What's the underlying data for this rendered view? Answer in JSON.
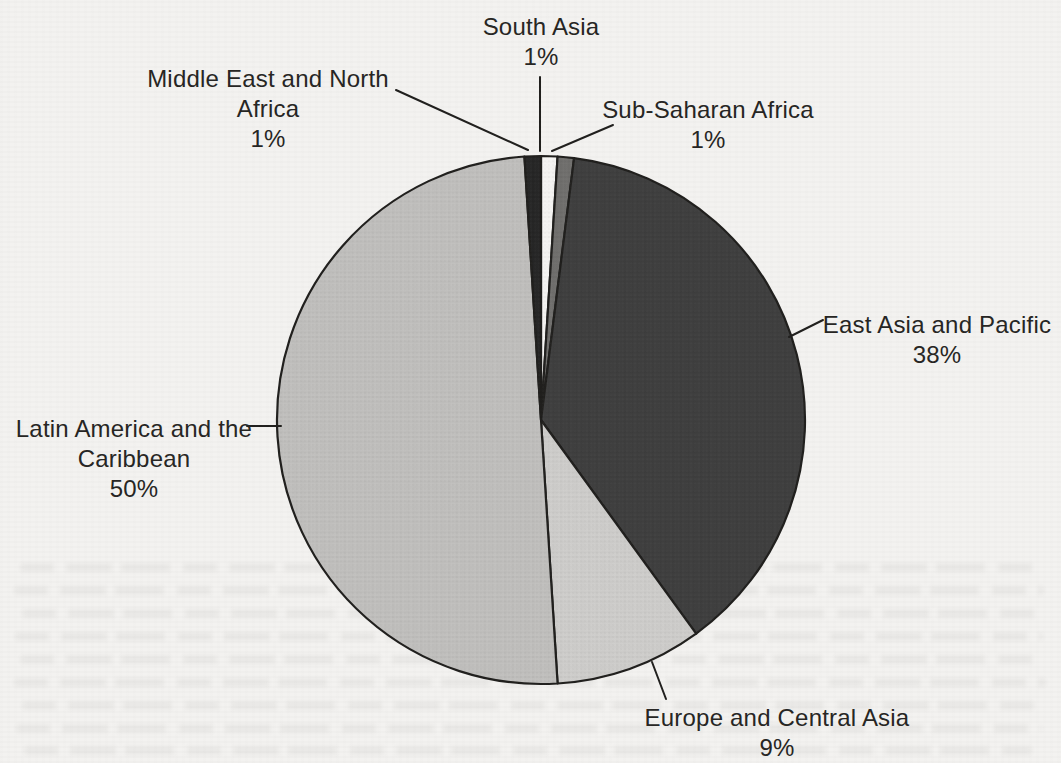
{
  "chart_data": {
    "type": "pie",
    "unit": "%",
    "legend": "none",
    "label_style": "outside-callouts-with-leader-lines",
    "outline_color": "#1d1c1a",
    "paper_color": "#f3f2f0",
    "slices": [
      {
        "id": "south-asia",
        "label": "South Asia",
        "value": 1,
        "pct_label": "1%",
        "color": "#f5f4f2",
        "label_lines": [
          "South Asia",
          "1%"
        ]
      },
      {
        "id": "sub-saharan-africa",
        "label": "Sub-Saharan Africa",
        "value": 1,
        "pct_label": "1%",
        "color": "#6e6d6b",
        "label_lines": [
          "Sub-Saharan Africa",
          "1%"
        ]
      },
      {
        "id": "east-asia-pacific",
        "label": "East Asia and Pacific",
        "value": 38,
        "pct_label": "38%",
        "color": "#3c3c3c",
        "label_lines": [
          "East Asia and Pacific",
          "38%"
        ]
      },
      {
        "id": "europe-central-asia",
        "label": "Europe and Central Asia",
        "value": 9,
        "pct_label": "9%",
        "color": "#cdccca",
        "label_lines": [
          "Europe and Central Asia",
          "9%"
        ]
      },
      {
        "id": "latin-america-caribbean",
        "label": "Latin America and the Caribbean",
        "value": 50,
        "pct_label": "50%",
        "color": "#bfbebc",
        "label_lines": [
          "Latin America and the",
          "Caribbean",
          "50%"
        ]
      },
      {
        "id": "middle-east-north-africa",
        "label": "Middle East and North Africa",
        "value": 1,
        "pct_label": "1%",
        "color": "#232323",
        "label_lines": [
          "Middle East and North",
          "Africa",
          "1%"
        ]
      }
    ],
    "start_angle_deg": 0,
    "direction": "clockwise"
  }
}
